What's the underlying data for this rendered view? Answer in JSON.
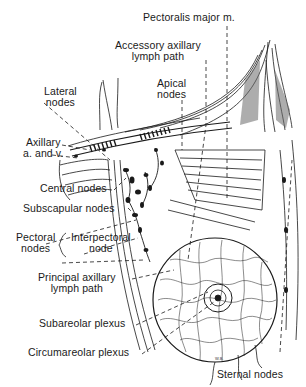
{
  "figure": {
    "labels": {
      "pectoralis_major": "Pectoralis major m.",
      "accessory_axillary_1": "Accessory axillary",
      "accessory_axillary_2": "lymph path",
      "apical_1": "Apical",
      "apical_2": "nodes",
      "lateral_1": "Lateral",
      "lateral_2": "nodes",
      "axillary_1": "Axillary",
      "axillary_2": "a. and v.",
      "central": "Central nodes",
      "subscapular": "Subscapular nodes",
      "pectoral_1": "Pectoral",
      "pectoral_2": "nodes",
      "interpectoral_1": "Interpectoral",
      "interpectoral_2": "node",
      "principal_axillary_1": "Principal axillary",
      "principal_axillary_2": "lymph path",
      "subareolar": "Subareolar plexus",
      "circumareolar": "Circumareolar plexus",
      "sternal": "Sternal nodes"
    },
    "signature": "W.B.",
    "colors": {
      "ink": "#1a1a1a",
      "background": "#ffffff",
      "shade": "#6b6b6b"
    }
  }
}
